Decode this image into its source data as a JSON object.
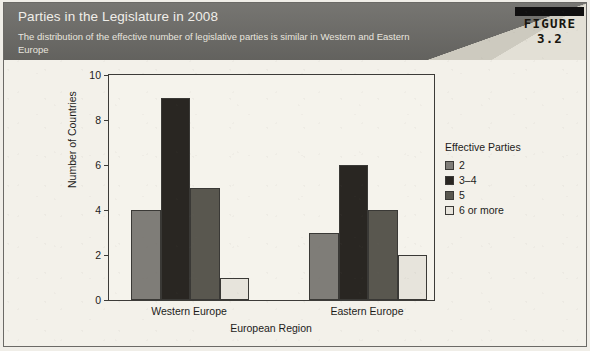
{
  "figure": {
    "title": "Parties in the Legislature in 2008",
    "subtitle": "The distribution of the effective number of legislative parties is similar in Western and Eastern Europe",
    "number_label": "FIGURE 3.2"
  },
  "legend": {
    "title": "Effective Parties",
    "items": [
      {
        "label": "2",
        "color": "#7f7d78"
      },
      {
        "label": "3–4",
        "color": "#292622"
      },
      {
        "label": "5",
        "color": "#59574f"
      },
      {
        "label": "6 or more",
        "color": "#e7e4dc"
      }
    ]
  },
  "axes": {
    "y_title": "Number of Countries",
    "x_title": "European Region",
    "y_ticks": [
      0,
      2,
      4,
      6,
      8,
      10
    ]
  },
  "chart_data": {
    "type": "bar",
    "title": "Parties in the Legislature in 2008",
    "subtitle": "The distribution of the effective number of legislative parties is similar in Western and Eastern Europe",
    "xlabel": "European Region",
    "ylabel": "Number of Countries",
    "ylim": [
      0,
      10
    ],
    "yticks": [
      0,
      2,
      4,
      6,
      8,
      10
    ],
    "grid": false,
    "legend_title": "Effective Parties",
    "legend_position": "right",
    "categories": [
      "Western Europe",
      "Eastern Europe"
    ],
    "series": [
      {
        "name": "2",
        "color": "#7f7d78",
        "values": [
          4,
          3
        ]
      },
      {
        "name": "3–4",
        "color": "#292622",
        "values": [
          9,
          6
        ]
      },
      {
        "name": "5",
        "color": "#59574f",
        "values": [
          5,
          4
        ]
      },
      {
        "name": "6 or more",
        "color": "#e7e4dc",
        "values": [
          1,
          2
        ]
      }
    ]
  }
}
